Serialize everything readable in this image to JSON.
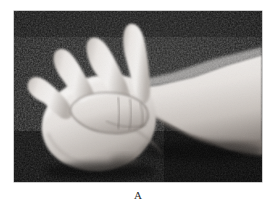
{
  "figure": {
    "caption": "A",
    "panel_label": "A",
    "media_type": "grayscale-photograph",
    "frame": {
      "x": 14,
      "y": 11,
      "width": 248,
      "height": 171
    }
  },
  "colors": {
    "page_background": "#ffffff",
    "photo_background_dark": "#0e0e0e",
    "photo_background_mid": "#2a2a2a",
    "skin_highlight": "#f2f0ee",
    "skin_light": "#e2dedb",
    "skin_mid": "#c9c4c0",
    "skin_shadow": "#9a938e",
    "skin_deep_shadow": "#6a635e",
    "crease_line": "#5a534e",
    "frame_border": "#9a9a9a",
    "caption_text": "#2b2b2b"
  },
  "anatomy": {
    "parts": [
      {
        "name": "little-finger",
        "label": "little finger"
      },
      {
        "name": "ring-finger",
        "label": "ring finger"
      },
      {
        "name": "middle-finger",
        "label": "middle finger"
      },
      {
        "name": "index-finger",
        "label": "index finger"
      },
      {
        "name": "thumb",
        "label": "thumb"
      },
      {
        "name": "palm",
        "label": "palm"
      },
      {
        "name": "wrist",
        "label": "wrist"
      },
      {
        "name": "forearm",
        "label": "forearm"
      }
    ]
  }
}
